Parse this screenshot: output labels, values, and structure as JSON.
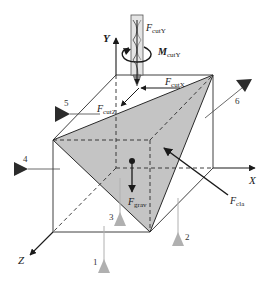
{
  "figure": {
    "type": "fixture-workpiece force diagram",
    "axes": {
      "x": "X",
      "y": "Y",
      "z": "Z"
    },
    "forces": {
      "cut_y": {
        "symbol": "F",
        "subscript": "cutY"
      },
      "moment_y": {
        "symbol": "M",
        "subscript": "cutY"
      },
      "cut_x": {
        "symbol": "F",
        "subscript": "cutX"
      },
      "cut_z": {
        "symbol": "F",
        "subscript": "cutZ"
      },
      "gravity": {
        "symbol": "F",
        "subscript": "grav"
      },
      "clamp": {
        "symbol": "F",
        "subscript": "cla"
      }
    },
    "locators": [
      "1",
      "2",
      "3",
      "4",
      "5",
      "6"
    ],
    "colors": {
      "line": "#2a2a2a",
      "workpiece_fill": "#c4c4c4",
      "locator_dark": "#2b2b2b",
      "locator_light": "#b0b0b0",
      "tool_fill": "#e4e4e4"
    }
  }
}
